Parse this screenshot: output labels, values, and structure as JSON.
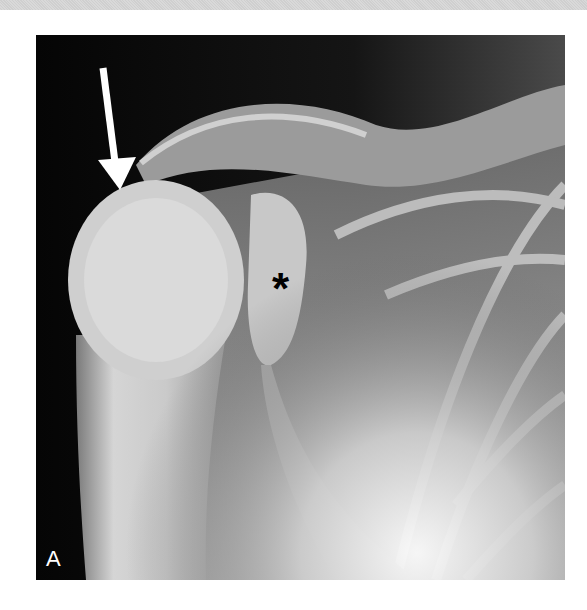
{
  "figure": {
    "panel_label": "A",
    "annotations": {
      "asterisk": "*",
      "arrow": "white-arrow-pointing-down"
    },
    "colors": {
      "background": "#0a0a0a",
      "bone": "#d8d8d8",
      "soft_tissue": "#8a8a8a",
      "annotation_arrow": "#ffffff",
      "asterisk": "#000000",
      "page_background": "#ffffff"
    }
  }
}
